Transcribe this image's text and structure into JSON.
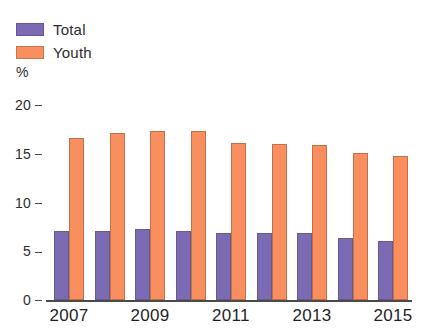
{
  "legend": {
    "items": [
      {
        "label": "Total",
        "color": "#7B6BB5",
        "icon": "legend-swatch-icon"
      },
      {
        "label": "Youth",
        "color": "#F98E5E",
        "icon": "legend-swatch-icon"
      }
    ]
  },
  "axis": {
    "unit_label": "%",
    "y_ticks": [
      "20",
      "15",
      "10",
      "5",
      "0"
    ],
    "x_labels": [
      "2007",
      "2009",
      "2011",
      "2013",
      "2015"
    ]
  },
  "chart_data": {
    "type": "bar",
    "title": "",
    "subtitle": "",
    "xlabel": "",
    "ylabel": "%",
    "ylim": [
      0,
      20
    ],
    "yticks": [
      0,
      5,
      10,
      15,
      20
    ],
    "grid": false,
    "legend_position": "top-left",
    "categories": [
      "2007",
      "2008",
      "2009",
      "2010",
      "2011",
      "2012",
      "2013",
      "2014",
      "2015"
    ],
    "visible_tick_labels": [
      "2007",
      "2009",
      "2011",
      "2013",
      "2015"
    ],
    "series": [
      {
        "name": "Total",
        "color": "#7B6BB5",
        "values": [
          7.1,
          7.1,
          7.3,
          7.1,
          6.9,
          6.9,
          6.9,
          6.4,
          6.1
        ]
      },
      {
        "name": "Youth",
        "color": "#F98E5E",
        "values": [
          16.6,
          17.1,
          17.3,
          17.3,
          16.1,
          16.0,
          15.9,
          15.1,
          14.8
        ]
      }
    ]
  }
}
